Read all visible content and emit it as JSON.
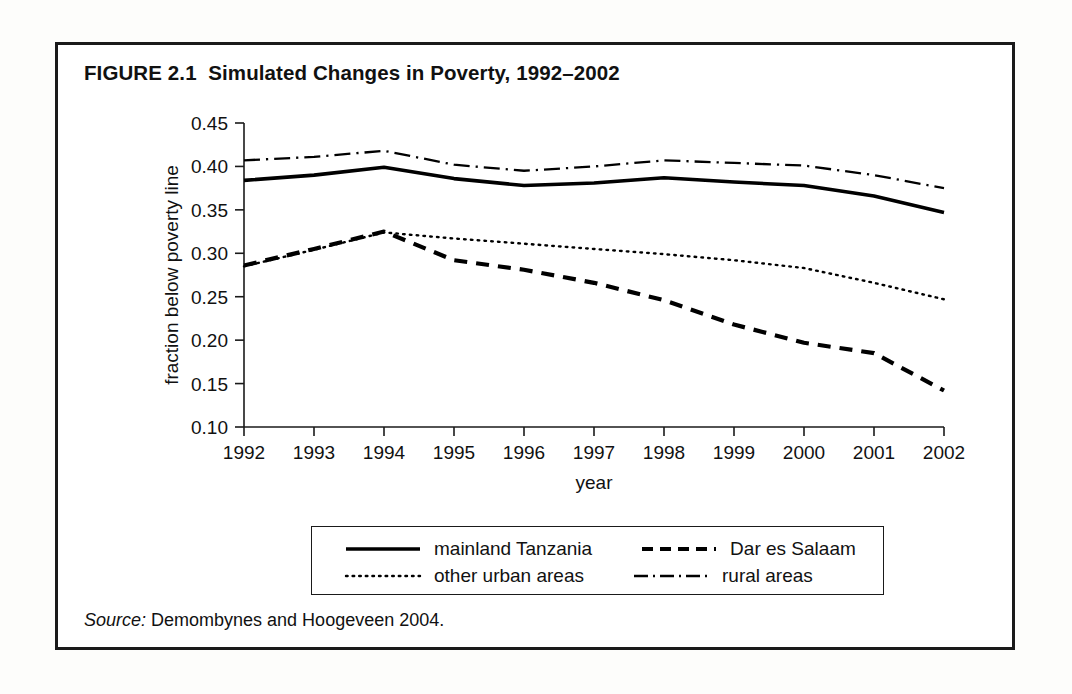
{
  "figure": {
    "title": "FIGURE 2.1  Simulated Changes in Poverty, 1992–2002",
    "source_keyword": "Source:",
    "source_text": " Demombynes and Hoogeveen 2004."
  },
  "legend": {
    "entries": [
      {
        "label": "mainland Tanzania",
        "style": "solid",
        "icon": "solid-line-icon"
      },
      {
        "label": "Dar es Salaam",
        "style": "dashed",
        "icon": "dashed-line-icon"
      },
      {
        "label": "other urban areas",
        "style": "dotted",
        "icon": "dotted-line-icon"
      },
      {
        "label": "rural areas",
        "style": "dash-dot",
        "icon": "dash-dot-line-icon"
      }
    ]
  },
  "chart_data": {
    "type": "line",
    "title": "FIGURE 2.1  Simulated Changes in Poverty, 1992–2002",
    "xlabel": "year",
    "ylabel": "fraction below poverty line",
    "categories": [
      "1992",
      "1993",
      "1994",
      "1995",
      "1996",
      "1997",
      "1998",
      "1999",
      "2000",
      "2001",
      "2002"
    ],
    "x": [
      1992,
      1993,
      1994,
      1995,
      1996,
      1997,
      1998,
      1999,
      2000,
      2001,
      2002
    ],
    "xlim": [
      1992,
      2002
    ],
    "ylim": [
      0.1,
      0.45
    ],
    "yticks": [
      0.1,
      0.15,
      0.2,
      0.25,
      0.3,
      0.35,
      0.4,
      0.45
    ],
    "ytick_labels": [
      "0.10",
      "0.15",
      "0.20",
      "0.25",
      "0.30",
      "0.35",
      "0.40",
      "0.45"
    ],
    "xticks": [
      1992,
      1993,
      1994,
      1995,
      1996,
      1997,
      1998,
      1999,
      2000,
      2001,
      2002
    ],
    "grid": false,
    "legend_position": "below",
    "series": [
      {
        "name": "mainland Tanzania",
        "style": "solid",
        "values": [
          0.384,
          0.39,
          0.399,
          0.386,
          0.378,
          0.381,
          0.387,
          0.382,
          0.378,
          0.366,
          0.347
        ]
      },
      {
        "name": "Dar es Salaam",
        "style": "dashed",
        "values": [
          0.286,
          0.305,
          0.325,
          0.292,
          0.281,
          0.266,
          0.246,
          0.218,
          0.197,
          0.185,
          0.142
        ]
      },
      {
        "name": "other urban areas",
        "style": "dotted",
        "values": [
          0.285,
          0.304,
          0.324,
          0.317,
          0.311,
          0.305,
          0.299,
          0.292,
          0.283,
          0.266,
          0.247
        ]
      },
      {
        "name": "rural areas",
        "style": "dash-dot",
        "values": [
          0.407,
          0.411,
          0.418,
          0.402,
          0.395,
          0.4,
          0.407,
          0.404,
          0.401,
          0.39,
          0.375
        ]
      }
    ]
  }
}
